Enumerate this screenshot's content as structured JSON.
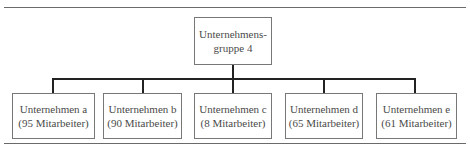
{
  "diagram": {
    "root": {
      "line1": "Unternehmens-",
      "line2": "gruppe 4"
    },
    "children": [
      {
        "name": "Unternehmen a",
        "employees": "(95 Mitarbeiter)"
      },
      {
        "name": "Unternehmen b",
        "employees": "(90 Mitarbeiter)"
      },
      {
        "name": "Unternehmen c",
        "employees": "(8 Mitarbeiter)"
      },
      {
        "name": "Unternehmen d",
        "employees": "(65 Mitarbeiter)"
      },
      {
        "name": "Unternehmen e",
        "employees": "(61 Mitarbeiter)"
      }
    ]
  }
}
